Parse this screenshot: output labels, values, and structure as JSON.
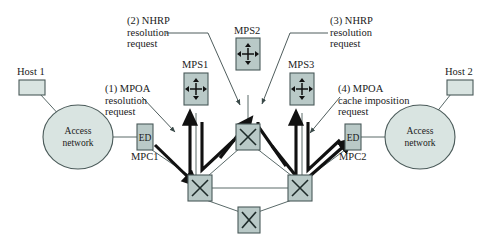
{
  "diagram": {
    "colors": {
      "node_fill": "#b9c9c7",
      "node_stroke": "#4a5a59",
      "circle_fill": "#d9e4e1",
      "line": "#5a6a69",
      "thick_arrow": "#111111",
      "text": "#1a1a1a",
      "background": "#ffffff"
    },
    "annotations": [
      {
        "id": "a1",
        "label": "(1) MPOA\nresolution\nrequest",
        "lines": [
          "(1) MPOA",
          "resolution",
          "request"
        ]
      },
      {
        "id": "a2",
        "label": "(2) NHRP\nresolution\nrequest",
        "lines": [
          "(2) NHRP",
          "resolution",
          "request"
        ]
      },
      {
        "id": "a3",
        "label": "(3) NHRP\nresolution\nrequest",
        "lines": [
          "(3) NHRP",
          "resolution",
          "request"
        ]
      },
      {
        "id": "a4",
        "label": "(4) MPOA\ncache imposition\nrequest",
        "lines": [
          "(4) MPOA",
          "cache imposition",
          "request"
        ]
      }
    ],
    "hosts": [
      {
        "id": "host1",
        "label": "Host 1"
      },
      {
        "id": "host2",
        "label": "Host 2"
      }
    ],
    "access_networks": [
      {
        "id": "an-left",
        "line1": "Access",
        "line2": "network"
      },
      {
        "id": "an-right",
        "line1": "Access",
        "line2": "network"
      }
    ],
    "edge_devices": [
      {
        "id": "ed1",
        "label": "ED",
        "sublabel": "MPC1"
      },
      {
        "id": "ed2",
        "label": "ED",
        "sublabel": "MPC2"
      }
    ],
    "mps_routers": [
      {
        "id": "mps1",
        "label": "MPS1",
        "icon": "router-icon"
      },
      {
        "id": "mps2",
        "label": "MPS2",
        "icon": "router-icon"
      },
      {
        "id": "mps3",
        "label": "MPS3",
        "icon": "router-icon"
      }
    ],
    "switches": [
      {
        "id": "sw-top",
        "icon": "switch-icon"
      },
      {
        "id": "sw-left",
        "icon": "switch-icon"
      },
      {
        "id": "sw-right",
        "icon": "switch-icon"
      },
      {
        "id": "sw-bottom",
        "icon": "switch-icon"
      }
    ]
  }
}
